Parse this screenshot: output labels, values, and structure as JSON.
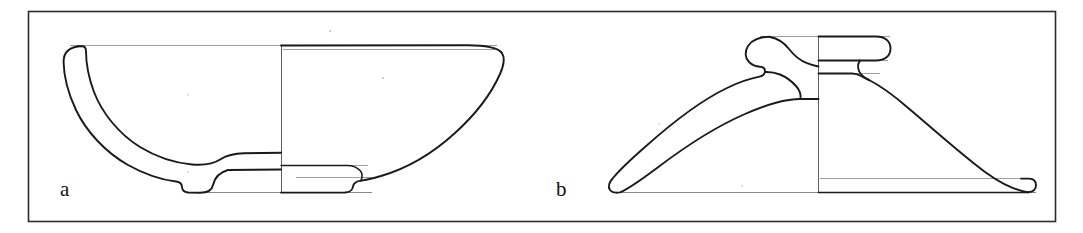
{
  "plate": {
    "title": "Pottery profile drawings",
    "background_color": "#ffffff",
    "frame_color": "#2b2b2b",
    "ink_color": "#1a1a1a",
    "construction_line_color": "#8d8d8d",
    "width": 1083,
    "height": 233
  },
  "figures": [
    {
      "label": "a",
      "name": "shallow-footed-bowl",
      "description": "Shallow carinated bowl with everted rim and low ring foot; left half drawn as cross-section, right half as exterior profile",
      "label_x": 60,
      "label_y": 196,
      "axis_x": 281,
      "rim_y": 45,
      "base_y": 192,
      "rim_left_x": 63,
      "rim_right_x": 503
    },
    {
      "label": "b",
      "name": "conical-lid-with-knob",
      "description": "Conical lid with central cylindrical knob handle and rounded rim; left half drawn as cross-section, right half as exterior profile",
      "label_x": 556,
      "label_y": 196,
      "axis_x": 818,
      "knob_top_y": 36,
      "base_y": 192,
      "rim_left_x": 608,
      "rim_right_x": 1036
    }
  ],
  "annotations": {
    "drawing_convention": "Archaeological ceramic profile: section on the left of the vertical axis, exterior elevation on the right."
  }
}
